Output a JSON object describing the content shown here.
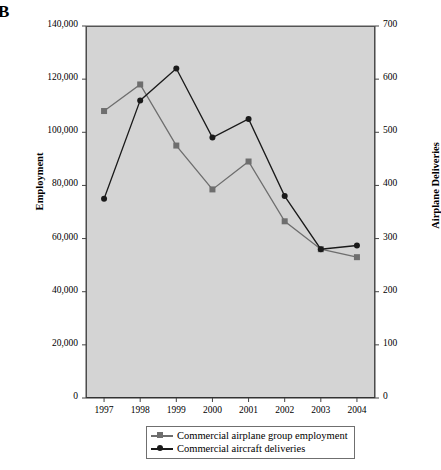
{
  "panel": {
    "label": "B"
  },
  "chart_data": {
    "type": "line",
    "title": "",
    "xlabel": "",
    "ylabel": "Employment",
    "y2label": "Airplane Deliveries",
    "categories": [
      "1997",
      "1998",
      "1999",
      "2000",
      "2001",
      "2002",
      "2003",
      "2004"
    ],
    "ylim": [
      0,
      140000
    ],
    "y2lim": [
      0,
      700
    ],
    "yticks": [
      "0",
      "20,000",
      "40,000",
      "60,000",
      "80,000",
      "100,000",
      "120,000",
      "140,000"
    ],
    "ytick_values": [
      0,
      20000,
      40000,
      60000,
      80000,
      100000,
      120000,
      140000
    ],
    "y2ticks": [
      "0",
      "100",
      "200",
      "300",
      "400",
      "500",
      "600",
      "700"
    ],
    "y2tick_values": [
      0,
      100,
      200,
      300,
      400,
      500,
      600,
      700
    ],
    "grid": false,
    "legend_position": "bottom",
    "series": [
      {
        "name": "Commercial airplane group employment",
        "axis": "left",
        "marker": "square",
        "color": "#6e6e6e",
        "values": [
          108000,
          118000,
          95000,
          78500,
          89000,
          66500,
          56000,
          53000
        ]
      },
      {
        "name": "Commercial aircraft deliveries",
        "axis": "right",
        "marker": "circle",
        "color": "#1a1a1a",
        "values": [
          375,
          560,
          620,
          490,
          525,
          380,
          280,
          287
        ]
      }
    ]
  },
  "style": {
    "plot_background": "#d4d4d4",
    "page_background": "#ffffff",
    "axis_color": "#444444"
  }
}
